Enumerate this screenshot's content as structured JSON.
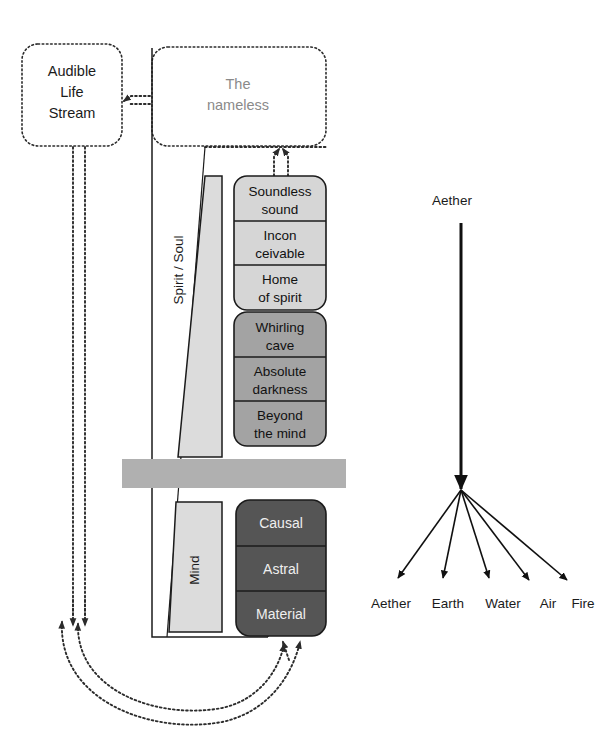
{
  "figure": {
    "title": "",
    "left_panel": {
      "audible_life_stream": {
        "lines": [
          "Audible",
          "Life",
          "Stream"
        ]
      },
      "nameless_box": {
        "lines": [
          "The",
          "nameless"
        ]
      },
      "spirit_soul_label": "Spirit / Soul",
      "mind_label": "Mind",
      "upper_groups": [
        {
          "name": "spirit-group",
          "shade": "#d6d6d6",
          "text_color": "#111111",
          "cells": [
            {
              "lines": [
                "Soundless",
                "sound"
              ]
            },
            {
              "lines": [
                "Incon",
                "ceivable"
              ]
            },
            {
              "lines": [
                "Home",
                "of spirit"
              ]
            }
          ]
        },
        {
          "name": "mind-group",
          "shade": "#a3a3a3",
          "text_color": "#111111",
          "cells": [
            {
              "lines": [
                "Whirling",
                "cave"
              ]
            },
            {
              "lines": [
                "Absolute",
                "darkness"
              ]
            },
            {
              "lines": [
                "Beyond",
                "the mind"
              ]
            }
          ]
        }
      ],
      "lower_group": {
        "name": "material-group",
        "shade": "#555555",
        "text_color": "#efefef",
        "cells": [
          {
            "lines": [
              "Causal"
            ]
          },
          {
            "lines": [
              "Astral"
            ]
          },
          {
            "lines": [
              "Material"
            ]
          }
        ]
      }
    },
    "right_panel": {
      "source_label": "Aether",
      "element_labels": [
        "Aether",
        "Earth",
        "Water",
        "Air",
        "Fire"
      ]
    },
    "colors": {
      "light_gray": "#d6d6d6",
      "mid_gray": "#a3a3a3",
      "dark_gray": "#555555",
      "bar_gray": "#b0b0b0",
      "wedge_gray": "#dcdcdc",
      "ink": "#1b1b1b",
      "nameless_text": "#8a8a8a"
    }
  }
}
